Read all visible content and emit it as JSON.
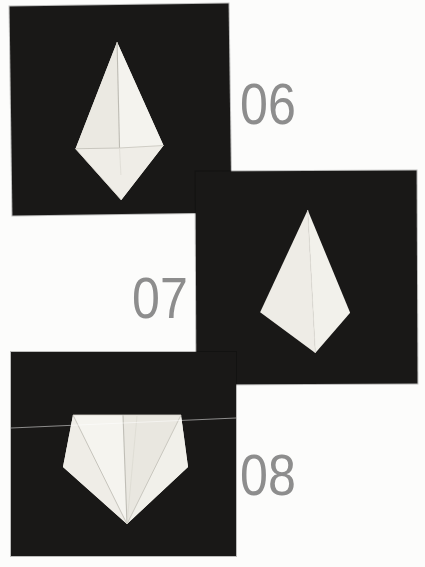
{
  "page": {
    "type": "origami-instruction-book-page",
    "background_color": "#fcfcfb"
  },
  "colors": {
    "photo_background": "#191817",
    "paper": "#f0efe9",
    "paper_shadow_facet": "#eae8e1",
    "paper_bright_facet": "#f5f4ef",
    "crease_line": "#c6c4bc",
    "step_number_gray": "#8d8d8d"
  },
  "steps": [
    {
      "number": "06",
      "photo": "origami-kite-base-with-side-flaps-folded-to-center",
      "photo_background": "black",
      "paper_color": "off-white"
    },
    {
      "number": "07",
      "photo": "origami-plain-kite-shape-turned-over",
      "photo_background": "black",
      "paper_color": "off-white"
    },
    {
      "number": "08",
      "photo": "origami-pentagon-shape-top-corners-folded-down",
      "photo_background": "black",
      "paper_color": "off-white",
      "artifact": "thin-white-horizontal-scratch-line"
    }
  ]
}
